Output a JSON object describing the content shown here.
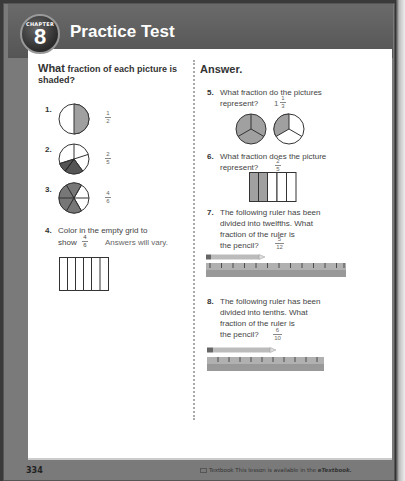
{
  "header": {
    "chapter_label": "CHAPTER",
    "chapter_number": "8",
    "title": "Practice Test"
  },
  "left_column": {
    "heading_big": "What",
    "heading_rest": "fraction of each picture is shaded?",
    "questions": [
      {
        "number": "1.",
        "answer_num": "1",
        "answer_den": "2",
        "figure": "circle-halves",
        "shaded": 1,
        "parts": 2
      },
      {
        "number": "2.",
        "answer_num": "2",
        "answer_den": "5",
        "figure": "circle-fifths",
        "shaded": 2,
        "parts": 5
      },
      {
        "number": "3.",
        "answer_num": "4",
        "answer_den": "6",
        "figure": "circle-sixths",
        "shaded": 4,
        "parts": 6
      },
      {
        "number": "4.",
        "text_line1": "Color in the empty grid to",
        "text_line2": "show",
        "frac_num": "4",
        "frac_den": "6",
        "answer": "Answers will vary.",
        "figure": "grid-6"
      }
    ]
  },
  "right_column": {
    "heading": "Answer.",
    "questions": [
      {
        "number": "5.",
        "text_line1": "What fraction do the pictures",
        "text_line2": "represent?",
        "answer_whole": "1",
        "answer_num": "1",
        "answer_den": "3"
      },
      {
        "number": "6.",
        "text_line1": "What fraction does the picture",
        "text_line2": "represent?",
        "answer_num": "2",
        "answer_den": "5"
      },
      {
        "number": "7.",
        "text_line1": "The following ruler has been",
        "text_line2": "divided into twelfths. What",
        "text_line3": "fraction of the ruler is",
        "text_line4": "the pencil?",
        "answer_num": "5",
        "answer_den": "12"
      },
      {
        "number": "8.",
        "text_line1": "The following ruler has been",
        "text_line2": "divided into tenths. What",
        "text_line3": "fraction of the ruler is",
        "text_line4": "the pencil?",
        "answer_num": "6",
        "answer_den": "10"
      }
    ]
  },
  "footer": {
    "page_number": "334",
    "note_prefix": "Textbook",
    "note_text": "This lesson is available in the",
    "note_emph": "eTextbook."
  },
  "colors": {
    "header": "#5f5f5f",
    "shade": "#a0a0a0",
    "dark_shade": "#555555",
    "answer": "#666666"
  }
}
